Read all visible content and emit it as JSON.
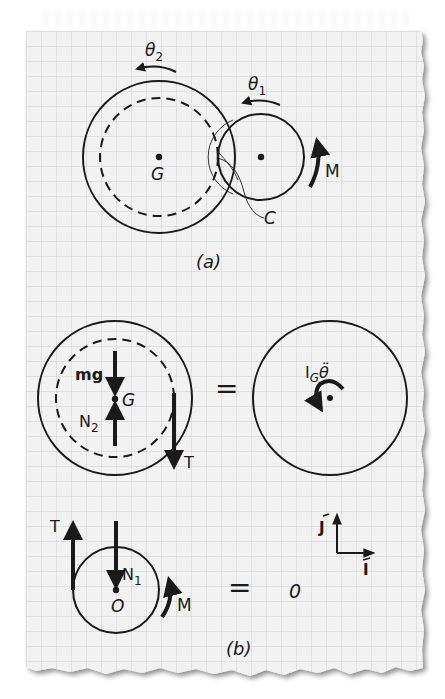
{
  "figure": {
    "background_color": "#ffffff",
    "paper_color": "#f2f2f2",
    "grid_color": "#cfcfcf",
    "ink_color": "#1a1a1a",
    "grid_spacing_px": 15
  },
  "part_a": {
    "caption": "(a)",
    "theta2_label": "θ",
    "theta2_sub": "2",
    "theta1_label": "θ",
    "theta1_sub": "1",
    "gear_large_center_label": "G",
    "contact_label": "C",
    "moment_label": "M"
  },
  "part_b": {
    "caption": "(b)",
    "fbd_gear_large": {
      "weight_label": "mg",
      "normal_label": "N",
      "normal_sub": "2",
      "center_label": "G",
      "tension_label": "T"
    },
    "equals_1": "=",
    "kinetic_diagram": {
      "inertia_label": "I",
      "inertia_sub": "G",
      "theta_ddot": "θ̈"
    },
    "fbd_gear_small": {
      "tension_label": "T",
      "normal_label": "N",
      "normal_sub": "1",
      "center_label": "O",
      "moment_label": "M"
    },
    "equals_2": "=",
    "zero_result": "0",
    "axes": {
      "j_label": "J",
      "i_label": "I"
    }
  }
}
